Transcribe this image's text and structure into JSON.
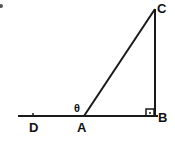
{
  "diagram": {
    "points": {
      "A": {
        "label": "A",
        "x": 84,
        "y": 116
      },
      "B": {
        "label": "B",
        "x": 155,
        "y": 116
      },
      "C": {
        "label": "C",
        "x": 155,
        "y": 9
      },
      "D": {
        "label": "D",
        "x": 33,
        "y": 116
      }
    },
    "angle_label": "θ",
    "right_angle_at": "B",
    "segments": [
      "AC",
      "CB",
      "DB"
    ],
    "colors": {
      "stroke": "#1a1a1a",
      "background": "#ffffff"
    }
  }
}
